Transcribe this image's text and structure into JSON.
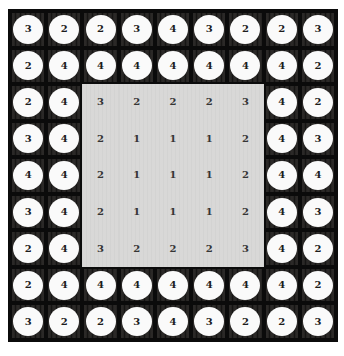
{
  "colors": {
    "page_bg": "#ffffff",
    "grid_line": "#0b0b0b",
    "dark_cell_stripe_dark": "#151413",
    "dark_cell_stripe_mid": "#211f1e",
    "dark_cell_stripe_light": "#343230",
    "token_circle_fill": "#fafafa",
    "token_number": "#1c1c1c",
    "light_region_stripe_dark": "#d3d3d2",
    "light_region_stripe_light": "#dedddc",
    "light_region_number": "#353535"
  },
  "board": {
    "rows": 9,
    "cols": 9,
    "inner_plain_region": {
      "row_start": 3,
      "row_end": 7,
      "col_start": 3,
      "col_end": 7
    }
  },
  "chart_data": {
    "type": "heatmap",
    "title": "",
    "xlabel": "",
    "ylabel": "",
    "rows": 9,
    "cols": 9,
    "cell_styles": {
      "outer_two_rings": "dark textured cell with white circular token containing number",
      "inner_5x5": "light gray flat region with plain number"
    },
    "values": [
      [
        3,
        2,
        2,
        3,
        4,
        3,
        2,
        2,
        3
      ],
      [
        2,
        4,
        4,
        4,
        4,
        4,
        4,
        4,
        2
      ],
      [
        2,
        4,
        3,
        2,
        2,
        2,
        3,
        4,
        2
      ],
      [
        3,
        4,
        2,
        1,
        1,
        1,
        2,
        4,
        3
      ],
      [
        4,
        4,
        2,
        1,
        1,
        1,
        2,
        4,
        4
      ],
      [
        3,
        4,
        2,
        1,
        1,
        1,
        2,
        4,
        3
      ],
      [
        2,
        4,
        3,
        2,
        2,
        2,
        3,
        4,
        2
      ],
      [
        2,
        4,
        4,
        4,
        4,
        4,
        4,
        4,
        2
      ],
      [
        3,
        2,
        2,
        3,
        4,
        3,
        2,
        2,
        3
      ]
    ]
  }
}
